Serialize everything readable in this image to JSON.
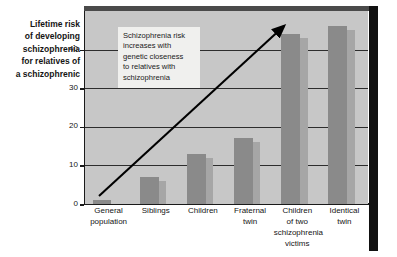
{
  "chart_data": {
    "type": "bar",
    "title": "Lifetime risk\nof developing\nschizophrenia\nfor relatives of\na schizophrenic",
    "xlabel": "",
    "ylabel": "Lifetime risk of developing schizophrenia for relatives of a schizophrenic",
    "ylim": [
      0,
      50
    ],
    "yticks": [
      0,
      10,
      20,
      30,
      40
    ],
    "ytick_labels": [
      "0",
      "10",
      "20",
      "30",
      "40"
    ],
    "grid": true,
    "legend": "none",
    "categories": [
      "General\npopulation",
      "Siblings",
      "Children",
      "Fraternal\ntwin",
      "Children\nof two\nschizophrenia\nvictims",
      "Identical\ntwin"
    ],
    "values": [
      1,
      7,
      13,
      17,
      44,
      46
    ],
    "annotations": [
      {
        "text": "Schizophrenia risk\nincreases with\ngenetic closeness\nto relatives with\nschizophrenia",
        "type": "text-box"
      },
      {
        "text": "",
        "type": "trend-arrow",
        "direction": "up-right"
      }
    ],
    "colors": {
      "bar_front": "#8a8a8a",
      "bar_side": "#a6a6a6",
      "plot_background": "#c7c7c7",
      "gridline": "#2d2d2d",
      "axis": "#1a1a1a",
      "annotation_background": "#f0f0ee",
      "arrow": "#000000",
      "frame": "#111111",
      "text": "#151515"
    }
  }
}
